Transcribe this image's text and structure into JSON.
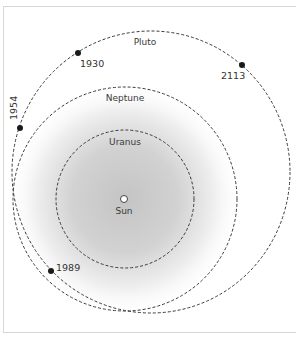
{
  "diagram": {
    "colors": {
      "orbit_stroke": "#3a3a3a",
      "glow_center": "#c4c4c4",
      "background": "#ffffff",
      "frame": "#d6d6d6"
    },
    "sun": {
      "label": "Sun",
      "cx": 125,
      "cy": 199
    },
    "orbits": [
      {
        "name": "Uranus",
        "label": "Uranus"
      },
      {
        "name": "Neptune",
        "label": "Neptune"
      },
      {
        "name": "Pluto",
        "label": "Pluto"
      }
    ],
    "pluto_positions": [
      {
        "year": "1930"
      },
      {
        "year": "1954"
      },
      {
        "year": "1989"
      },
      {
        "year": "2113"
      }
    ]
  }
}
